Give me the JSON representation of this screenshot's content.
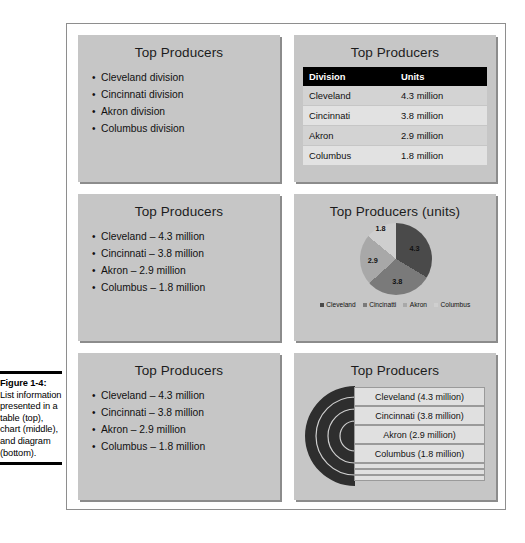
{
  "caption": {
    "label": "Figure 1-4:",
    "text": "List information presented in a table (top), chart (middle), and diagram (bottom)."
  },
  "slides": {
    "list_plain": {
      "title": "Top Producers",
      "bullets": [
        "Cleveland division",
        "Cincinnati division",
        "Akron division",
        "Columbus division"
      ]
    },
    "table": {
      "title": "Top Producers",
      "columns": [
        "Division",
        "Units"
      ],
      "rows": [
        [
          "Cleveland",
          "4.3 million"
        ],
        [
          "Cincinnati",
          "3.8 million"
        ],
        [
          "Akron",
          "2.9 million"
        ],
        [
          "Columbus",
          "1.8 million"
        ]
      ]
    },
    "list_values_middle": {
      "title": "Top Producers",
      "bullets": [
        "Cleveland – 4.3 million",
        "Cincinnati – 3.8 million",
        "Akron – 2.9 million",
        "Columbus – 1.8 million"
      ]
    },
    "chart": {
      "title": "Top Producers (units)"
    },
    "list_values_bottom": {
      "title": "Top Producers",
      "bullets": [
        "Cleveland – 4.3 million",
        "Cincinnati – 3.8 million",
        "Akron – 2.9 million",
        "Columbus – 1.8 million"
      ]
    },
    "diagram": {
      "title": "Top Producers",
      "items": [
        "Cleveland (4.3 million)",
        "Cincinnati (3.8 million)",
        "Akron (2.9 million)",
        "Columbus (1.8 million)"
      ]
    }
  },
  "chart_data": {
    "type": "pie",
    "title": "Top Producers (units)",
    "categories": [
      "Cleveland",
      "Cincinatti",
      "Akron",
      "Columbus"
    ],
    "values": [
      4.3,
      3.8,
      2.9,
      1.8
    ],
    "data_labels": [
      "4.3",
      "3.8",
      "2.9",
      "1.8"
    ],
    "legend": [
      "Cleveland",
      "Cincinatti",
      "Akron",
      "Columbus"
    ],
    "legend_position": "bottom",
    "colors": [
      "#4a4a4a",
      "#7a7a7a",
      "#a8a8a8",
      "#cfcfcf"
    ],
    "total": 12.8,
    "grid": false
  },
  "colors": {
    "slide_background": "#c6c6c6",
    "table_header": "#000000",
    "diagram_shape": "#2e2e2e",
    "frame_border": "#8e8e8e"
  }
}
